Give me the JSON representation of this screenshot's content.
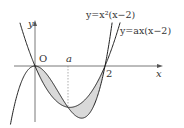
{
  "diagram": {
    "type": "function-graph",
    "curves": [
      {
        "id": "cubic",
        "label": "y=x²(x−2)",
        "equation": "y = x^2(x-2)"
      },
      {
        "id": "parabola",
        "label": "y=ax(x−2)",
        "equation": "y = ax(x-2)"
      }
    ],
    "axes": {
      "x_label": "x",
      "y_label": "y",
      "origin_label": "O"
    },
    "points": {
      "a_label": "a",
      "two_label": "2"
    },
    "shading": {
      "color": "#d9d9d9",
      "description": "regions enclosed between the two curves from 0 to a and from a to 2"
    },
    "colors": {
      "curve": "#222222",
      "axis": "#555555",
      "fill": "#d9d9d9",
      "dashed": "#777777"
    }
  },
  "labels": {
    "cubic_eq": "y=x²(x−2)",
    "parabola_eq": "y=ax(x−2)",
    "x": "x",
    "y": "y",
    "O": "O",
    "a": "a",
    "two": "2"
  }
}
